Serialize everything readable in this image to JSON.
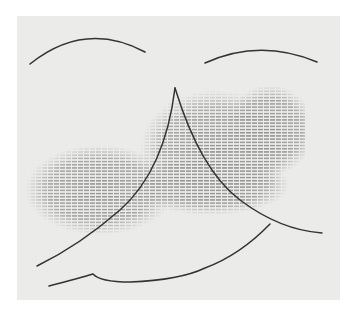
{
  "artwork": {
    "description": "Abstract line drawing of a face with arched eyebrows, a triangular nose, a mouth curve, and horizontal hatching shading",
    "colors": {
      "background": "#ffffff",
      "paper": "#ebebea",
      "ink": "#3a3a3a",
      "hatch": "#555555"
    }
  }
}
